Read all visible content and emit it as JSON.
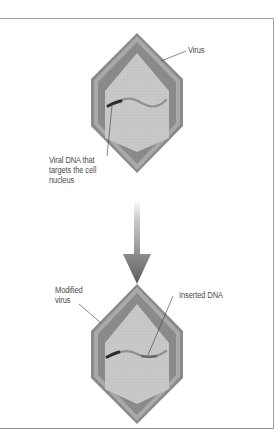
{
  "diagram": {
    "title": "",
    "colors": {
      "frame": "#9a9a9a",
      "shell_outer": "#8a8a8a",
      "shell_bevel": "#a9a9a9",
      "core": "#c9c9c9",
      "core_dots": "#b9b9b9",
      "dna_strand": "#8f8f8f",
      "dna_dark_segment": "#2e2e2e",
      "arrow": "#6e6e6e",
      "leader_line": "#3a3a3a",
      "label_text": "#4a4a4a"
    },
    "top_virus": {
      "label": "Virus",
      "dna_label_lines": [
        "Viral DNA that",
        "targets the cell",
        "nucleus"
      ]
    },
    "arrow": {
      "direction": "down",
      "meaning": "modification step"
    },
    "bottom_virus": {
      "label_lines": [
        "Modified",
        "virus"
      ],
      "dna_label": "Inserted DNA"
    }
  }
}
